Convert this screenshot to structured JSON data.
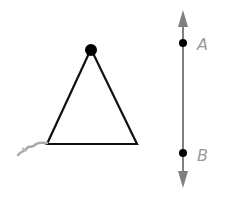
{
  "diagram": {
    "triangle": {
      "apex": [
        91,
        49
      ],
      "base_left": [
        47,
        144
      ],
      "base_right": [
        137,
        144
      ],
      "stroke": "#111111"
    },
    "line": {
      "x": 183,
      "top": 10,
      "bottom": 188,
      "color": "#808080"
    },
    "points": [
      {
        "label": "A",
        "y": 43
      },
      {
        "label": "B",
        "y": 153
      }
    ]
  }
}
